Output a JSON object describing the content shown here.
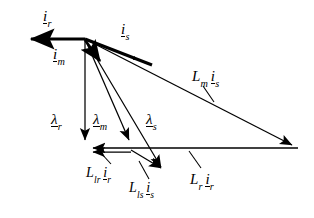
{
  "figure": {
    "kind": "space-vector phasor diagram",
    "background_color": "#ffffff",
    "stroke_color": "#000000",
    "canvas": {
      "width": 314,
      "height": 218
    }
  },
  "geometry": {
    "hub": {
      "x": 85,
      "y": 39
    },
    "left_tip": {
      "x": 22,
      "y": 39
    },
    "right_tip": {
      "x": 298,
      "y": 148
    },
    "bottom_tip": {
      "x": 85,
      "y": 148
    },
    "lambda_m_tip": {
      "x": 131,
      "y": 148
    },
    "lambda_s_tip": {
      "x": 168,
      "y": 174
    },
    "i_m_tip": {
      "x": 105,
      "y": 67
    },
    "i_s_mid_arrow": {
      "x": 142,
      "y": 62
    }
  },
  "vectors": [
    {
      "id": "i_r",
      "name": "rotor-current-vector",
      "weight": "thick",
      "from": "hub",
      "to": "left_tip"
    },
    {
      "id": "i_s",
      "name": "stator-current-vector",
      "weight": "thick",
      "from": "hub",
      "to": "right_tip"
    },
    {
      "id": "i_m",
      "name": "magnetizing-current-vector",
      "weight": "thick",
      "from": "hub",
      "to": "i_m_tip"
    },
    {
      "id": "lambda_r",
      "name": "rotor-flux-linkage-vector",
      "weight": "thin",
      "from": "hub",
      "to": "bottom_tip"
    },
    {
      "id": "lambda_m",
      "name": "mutual-flux-linkage-vector",
      "weight": "thin",
      "from": "hub",
      "to": "lambda_m_tip"
    },
    {
      "id": "lambda_s",
      "name": "stator-flux-linkage-vector",
      "weight": "thin",
      "from": "hub",
      "to": "lambda_s_tip"
    },
    {
      "id": "Lm_is",
      "name": "mutual-inductance-times-stator-current-vector",
      "weight": "thin",
      "from": "hub",
      "to": "right_tip"
    },
    {
      "id": "Lr_ir",
      "name": "rotor-inductance-times-rotor-current-vector",
      "weight": "thin",
      "from": "right_tip",
      "to": "bottom_tip"
    },
    {
      "id": "Llr_ir",
      "name": "rotor-leakage-inductance-times-rotor-current-vector",
      "weight": "thin",
      "from": "lambda_m_tip",
      "to": "bottom_tip"
    },
    {
      "id": "Lls_is",
      "name": "stator-leakage-inductance-times-stator-current-vector",
      "weight": "thin",
      "from": "lambda_m_tip",
      "to": "lambda_s_tip"
    }
  ],
  "labels": [
    {
      "id": "i_r_top",
      "name": "label-rotor-current",
      "base": "i",
      "sub": "r",
      "underlined": true,
      "x": 43,
      "y": 9,
      "size": 15,
      "text": "i r"
    },
    {
      "id": "i_s_top",
      "name": "label-stator-current",
      "base": "i",
      "sub": "s",
      "underlined": true,
      "x": 121,
      "y": 22,
      "size": 15,
      "text": "i s"
    },
    {
      "id": "i_m_left",
      "name": "label-magnetizing-current",
      "base": "i",
      "sub": "m",
      "underlined": true,
      "x": 53,
      "y": 47,
      "size": 15,
      "text": "i m"
    },
    {
      "id": "lambda_r",
      "name": "label-rotor-flux-linkage",
      "base": "λ",
      "sub": "r",
      "underlined": true,
      "x": 51,
      "y": 112,
      "size": 15,
      "text": "λ r"
    },
    {
      "id": "lambda_m",
      "name": "label-mutual-flux-linkage",
      "base": "λ",
      "sub": "m",
      "underlined": true,
      "x": 93,
      "y": 112,
      "size": 15,
      "text": "λ m"
    },
    {
      "id": "lambda_s",
      "name": "label-stator-flux-linkage",
      "base": "λ",
      "sub": "s",
      "underlined": true,
      "x": 146,
      "y": 112,
      "size": 15,
      "text": "λ s"
    },
    {
      "id": "Lm_is",
      "name": "label-mutual-inductance-stator-current",
      "lead_base": "L",
      "lead_sub": "m",
      "base": "i",
      "sub": "s",
      "underlined": true,
      "x": 192,
      "y": 69,
      "size": 15,
      "text": "L m i s"
    },
    {
      "id": "Llr_ir",
      "name": "label-rotor-leakage-inductance-rotor-current",
      "lead_base": "L",
      "lead_sub": "lr",
      "base": "i",
      "sub": "r",
      "underlined": true,
      "x": 86,
      "y": 166,
      "size": 14,
      "text": "L lr i r"
    },
    {
      "id": "Lls_is",
      "name": "label-stator-leakage-inductance-stator-current",
      "lead_base": "L",
      "lead_sub": "ls",
      "base": "i",
      "sub": "s",
      "underlined": true,
      "x": 129,
      "y": 181,
      "size": 14,
      "text": "L ls i s"
    },
    {
      "id": "Lr_ir",
      "name": "label-rotor-inductance-rotor-current",
      "lead_base": "L",
      "lead_sub": "r",
      "base": "i",
      "sub": "r",
      "underlined": true,
      "x": 190,
      "y": 172,
      "size": 15,
      "text": "L r i r"
    }
  ],
  "leader_lines": [
    {
      "name": "leader-Lm-is",
      "x1": 203,
      "y1": 86,
      "x2": 213,
      "y2": 101
    },
    {
      "name": "leader-Llr-ir",
      "x1": 110,
      "y1": 163,
      "x2": 100,
      "y2": 151
    },
    {
      "name": "leader-Lls-is",
      "x1": 148,
      "y1": 178,
      "x2": 138,
      "y2": 160
    },
    {
      "name": "leader-Lr-ir",
      "x1": 200,
      "y1": 168,
      "x2": 188,
      "y2": 151
    }
  ]
}
